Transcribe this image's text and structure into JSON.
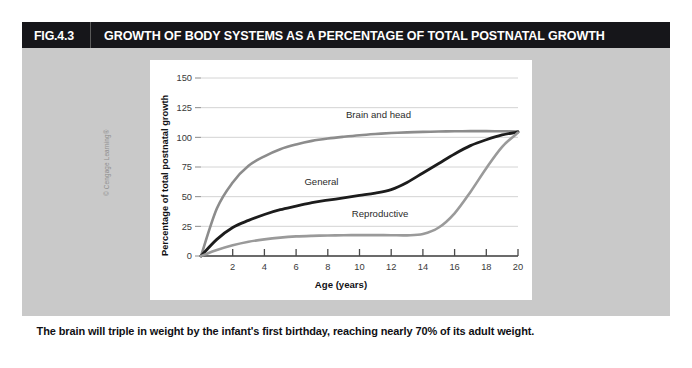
{
  "figure": {
    "number": "FIG.4.3",
    "title": "GROWTH OF BODY SYSTEMS AS A PERCENTAGE OF TOTAL POSTNATAL GROWTH",
    "caption": "The brain will triple in weight by the infant's first birthday, reaching nearly 70% of its adult weight.",
    "credit": "© Cengage Learning®",
    "header_bg": "#16161a",
    "body_bg": "#c9c9c9",
    "panel_bg": "#ffffff"
  },
  "chart_data": {
    "type": "line",
    "title": "GROWTH OF BODY SYSTEMS AS A PERCENTAGE OF TOTAL POSTNATAL GROWTH",
    "xlabel": "Age (years)",
    "ylabel": "Percentage of total postnatal growth",
    "xlim": [
      0,
      20
    ],
    "ylim": [
      0,
      150
    ],
    "xticks": [
      2,
      4,
      6,
      8,
      10,
      12,
      14,
      16,
      18,
      20
    ],
    "xtick_labels": [
      "2",
      "4",
      "6",
      "8",
      "10",
      "12",
      "14",
      "16",
      "18",
      "20"
    ],
    "yticks": [
      0,
      25,
      50,
      75,
      100,
      125,
      150
    ],
    "ytick_labels": [
      "0",
      "25",
      "50",
      "75",
      "100",
      "125",
      "150"
    ],
    "grid": "horizontal",
    "legend": "inline-annotations",
    "x": [
      0,
      1,
      2,
      3,
      4,
      5,
      6,
      7,
      8,
      9,
      10,
      11,
      12,
      13,
      14,
      15,
      16,
      17,
      18,
      19,
      20
    ],
    "series": [
      {
        "name": "Brain and head",
        "color": "#8c8c8c",
        "width": 2.6,
        "label_x": 11.2,
        "label_y": 116,
        "values": [
          0,
          40,
          62,
          76,
          84,
          90,
          94,
          97,
          99,
          100.5,
          101.8,
          102.8,
          103.6,
          104.2,
          104.6,
          104.9,
          105.1,
          105.2,
          105.2,
          105.1,
          104.8
        ]
      },
      {
        "name": "General",
        "color": "#1c1c1c",
        "width": 2.8,
        "label_x": 7.6,
        "label_y": 60,
        "values": [
          0,
          14,
          24,
          30,
          35,
          39,
          42,
          45,
          47,
          49,
          51,
          53,
          56,
          62,
          70,
          78,
          86,
          93,
          98,
          102,
          104.5
        ]
      },
      {
        "name": "Reproductive",
        "color": "#9a9a9a",
        "width": 2.6,
        "label_x": 11.3,
        "label_y": 33,
        "values": [
          0,
          5,
          9,
          12,
          14,
          15.5,
          16.5,
          17,
          17.3,
          17.5,
          17.6,
          17.6,
          17.5,
          17.4,
          18.5,
          24,
          36,
          54,
          74,
          92,
          104
        ]
      }
    ]
  }
}
